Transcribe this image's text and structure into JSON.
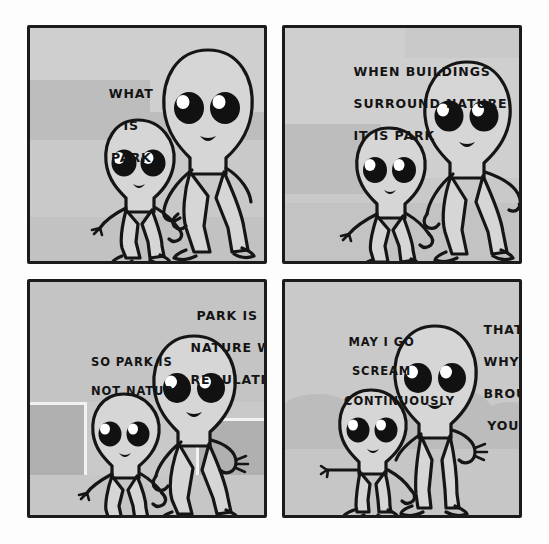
{
  "comic": {
    "title": "What Is Park",
    "style": "four-panel black-and-white webcomic, grey wash",
    "ink_color": "#151515",
    "panel_background": "#c9c9c9",
    "page_background": "#ffffff",
    "figure_fill": "#d6d6d6",
    "panels": [
      {
        "id": "panel-1",
        "position": "top-left",
        "scene": "two aliens walking hand in hand past faint buildings",
        "characters": [
          "small-alien-child",
          "tall-alien-adult"
        ],
        "captions": [
          {
            "id": "caption-1",
            "speaker": "small-alien-child",
            "align": "center",
            "lines": [
              "WHAT",
              "IS",
              "PARK"
            ],
            "text": "WHAT IS PARK"
          }
        ]
      },
      {
        "id": "panel-2",
        "position": "top-right",
        "scene": "tall alien gestures with free hand while explaining",
        "characters": [
          "small-alien-child",
          "tall-alien-adult"
        ],
        "captions": [
          {
            "id": "caption-2",
            "speaker": "tall-alien-adult",
            "align": "left",
            "lines": [
              "WHEN BUILDINGS",
              "SURROUND NATURE",
              "IT IS PARK"
            ],
            "text": "WHEN BUILDINGS SURROUND NATURE IT IS PARK"
          }
        ]
      },
      {
        "id": "panel-3",
        "position": "bottom-left",
        "scene": "the pair walk between two trimmed hedges",
        "characters": [
          "small-alien-child",
          "tall-alien-adult"
        ],
        "captions": [
          {
            "id": "caption-3",
            "speaker": "tall-alien-adult",
            "align": "center",
            "lines": [
              "PARK IS",
              "NATURE WITH",
              "REGULATIONS"
            ],
            "text": "PARK IS NATURE WITH REGULATIONS"
          },
          {
            "id": "caption-4",
            "speaker": "small-alien-child",
            "align": "left",
            "lines": [
              "SO PARK IS",
              "NOT NATURE"
            ],
            "text": "SO PARK IS NOT NATURE"
          }
        ]
      },
      {
        "id": "panel-4",
        "position": "bottom-right",
        "scene": "both aliens stand still in front of soft round bushes",
        "characters": [
          "small-alien-child",
          "tall-alien-adult"
        ],
        "captions": [
          {
            "id": "caption-5",
            "speaker": "small-alien-child",
            "align": "center",
            "lines": [
              "MAY I GO",
              "SCREAM",
              "CONTINUOUSLY"
            ],
            "text": "MAY I GO SCREAM CONTINUOUSLY"
          },
          {
            "id": "caption-6",
            "speaker": "tall-alien-adult",
            "align": "center",
            "lines": [
              "THAT IS",
              "WHY I",
              "BROUGHT",
              "YOU"
            ],
            "text": "THAT IS WHY I BROUGHT YOU"
          }
        ]
      }
    ]
  }
}
